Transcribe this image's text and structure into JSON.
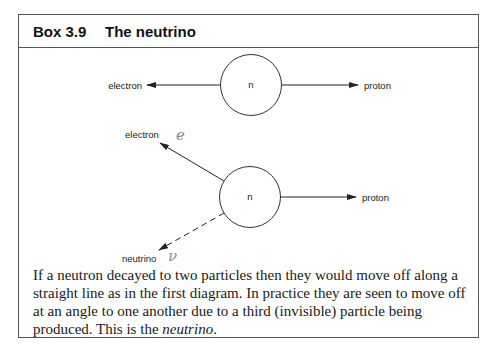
{
  "box": {
    "number": "Box 3.9",
    "title": "The neutrino"
  },
  "diagram1": {
    "nucleus_label": "n",
    "left_particle": "electron",
    "right_particle": "proton"
  },
  "diagram2": {
    "nucleus_label": "n",
    "upper_particle": "electron",
    "upper_annotation": "e",
    "lower_particle": "neutrino",
    "lower_annotation": "ν",
    "right_particle": "proton"
  },
  "caption": {
    "text_before": "If a neutron decayed to two particles then they would move off along a straight line as in the first diagram. In practice they are seen to move off at an angle to one another due to a third (invisible) particle being produced. This is the ",
    "emphasis": "neutrino",
    "text_after": "."
  },
  "colors": {
    "line": "#222222",
    "border": "#555555",
    "handwriting": "#8a8a8a"
  }
}
